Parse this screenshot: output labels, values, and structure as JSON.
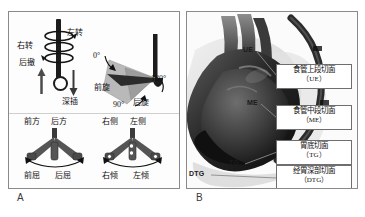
{
  "figure": {
    "panels": [
      {
        "letter": "A",
        "name": "probe-manipulation-diagram"
      },
      {
        "letter": "B",
        "name": "tee-view-levels-diagram"
      }
    ]
  },
  "panel_a": {
    "shaft_labels": {
      "left_turn": "左转",
      "right_turn": "右转",
      "withdraw": "后撤",
      "insert": "深插"
    },
    "rotation_labels": {
      "deg_0": "0°",
      "deg_90": "90°",
      "deg_180": "180°",
      "anterior_rotation": "前旋",
      "posterior_rotation": "后旋"
    },
    "flexion_diagram": {
      "top_left": "前方",
      "top_right": "后方",
      "bottom_left": "前屈",
      "bottom_right": "后屈"
    },
    "tilt_diagram": {
      "top_left": "右侧",
      "top_right": "左侧",
      "bottom_left": "右倾",
      "bottom_right": "左倾"
    }
  },
  "panel_b": {
    "markers": [
      {
        "id": "ue",
        "text": "UE"
      },
      {
        "id": "me",
        "text": "ME"
      },
      {
        "id": "tg",
        "text": "TG"
      },
      {
        "id": "dtg",
        "text": "DTG"
      }
    ],
    "callouts": [
      {
        "id": "ue",
        "title": "食管上段切面",
        "abbr": "（UE）"
      },
      {
        "id": "me",
        "title": "食管中段切面",
        "abbr": "（ME）"
      },
      {
        "id": "tg",
        "title": "胃底切面",
        "abbr": "（TG）"
      },
      {
        "id": "dtg",
        "title": "经胃深部切面",
        "abbr": "（DTG）"
      }
    ]
  },
  "colors": {
    "border": "#8a8a8a",
    "callout_border": "#6e6e6e",
    "shaft": "#1c1c1c",
    "wedge_light": "#b9b9b9",
    "wedge_dark": "#2b2b2b",
    "leader": "#777777",
    "text": "#111111"
  }
}
